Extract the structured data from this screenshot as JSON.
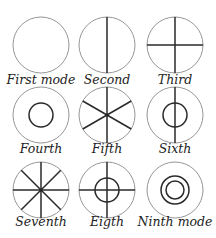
{
  "modes": [
    {
      "label": "First mode",
      "diameters": 0,
      "circles": 0
    },
    {
      "label": "Second",
      "diameters": 1,
      "circles": 0
    },
    {
      "label": "Third",
      "diameters": 2,
      "circles": 0
    },
    {
      "label": "Fourth",
      "diameters": 0,
      "circles": 1
    },
    {
      "label": "Fifth",
      "diameters": 3,
      "circles": 0
    },
    {
      "label": "Sixth",
      "diameters": 1,
      "circles": 1
    },
    {
      "label": "Seventh",
      "diameters": 4,
      "circles": 0
    },
    {
      "label": "Eigth",
      "diameters": 2,
      "circles": 1
    },
    {
      "label": "Ninth mode",
      "diameters": 0,
      "circles": 2
    }
  ]
}
